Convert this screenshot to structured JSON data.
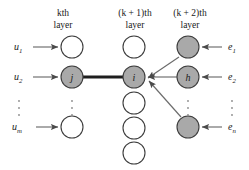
{
  "figure": {
    "kind": "neural-network-layer-diagram",
    "width": 249,
    "height": 170,
    "background": "#ffffff"
  },
  "colors": {
    "shaded_node_fill": "#a9a9a9",
    "white_node_fill": "#ffffff",
    "node_stroke": "#3d3d3d",
    "thin_edge": "#6b6b6b",
    "thick_edge": "#1e1e1e",
    "text": "#1a1a1a",
    "dots": "#8a8a8a"
  },
  "headers": [
    {
      "id": "layer-k",
      "var": "k",
      "prefix": "",
      "suffix": "th",
      "line1": "kth",
      "line2": "layer",
      "x": 63
    },
    {
      "id": "layer-k-plus-1",
      "var": "k",
      "prefix": "(",
      "suffix": " + 1)th",
      "line1": "(k + 1)th",
      "line2": "layer",
      "x": 135
    },
    {
      "id": "layer-k-plus-2",
      "var": "k",
      "prefix": "(",
      "suffix": " + 2)th",
      "line1": "(k + 2)th",
      "line2": "layer",
      "x": 188
    }
  ],
  "inputs": {
    "label_prefix": "u",
    "items": [
      {
        "id": "u1",
        "base": "u",
        "sub": "1",
        "y": 47
      },
      {
        "id": "u2",
        "base": "u",
        "sub": "2",
        "y": 77
      },
      {
        "id": "um",
        "base": "u",
        "sub": "m",
        "y": 127
      }
    ],
    "ellipsis_y": [
      101,
      108,
      115
    ],
    "ellipsis_x": 19
  },
  "outputs": {
    "label_prefix": "e",
    "items": [
      {
        "id": "e1",
        "base": "e",
        "sub": "1",
        "y": 47
      },
      {
        "id": "e2",
        "base": "e",
        "sub": "2",
        "y": 77
      },
      {
        "id": "en",
        "base": "e",
        "sub": "n",
        "y": 127
      }
    ],
    "ellipsis_y": [
      101,
      108,
      115
    ],
    "ellipsis_x": 231
  },
  "layers": [
    {
      "id": "layer-k",
      "name": "kth layer",
      "cx": 72,
      "nodes": [
        {
          "id": "k-node-1",
          "label": "",
          "shaded": false,
          "cy": 47,
          "r": 11
        },
        {
          "id": "k-node-j",
          "label": "j",
          "shaded": true,
          "cy": 77,
          "r": 11
        },
        {
          "id": "k-node-m",
          "label": "",
          "shaded": false,
          "cy": 127,
          "r": 11
        }
      ],
      "ellipsis_y": [
        101,
        108,
        115
      ]
    },
    {
      "id": "layer-k-plus-1",
      "name": "(k + 1)th layer",
      "cx": 134,
      "nodes": [
        {
          "id": "kp1-node-1",
          "label": "",
          "shaded": false,
          "cy": 47,
          "r": 11
        },
        {
          "id": "kp1-node-i",
          "label": "i",
          "shaded": true,
          "cy": 77,
          "r": 11
        },
        {
          "id": "kp1-node-3",
          "label": "",
          "shaded": false,
          "cy": 103,
          "r": 11
        },
        {
          "id": "kp1-node-4",
          "label": "",
          "shaded": false,
          "cy": 128,
          "r": 11
        },
        {
          "id": "kp1-node-5",
          "label": "",
          "shaded": false,
          "cy": 153,
          "r": 11
        }
      ],
      "ellipsis_y": []
    },
    {
      "id": "layer-k-plus-2",
      "name": "(k + 2)th layer",
      "cx": 188,
      "nodes": [
        {
          "id": "kp2-node-1",
          "label": "",
          "shaded": true,
          "cy": 47,
          "r": 11
        },
        {
          "id": "kp2-node-h",
          "label": "h",
          "shaded": true,
          "cy": 77,
          "r": 11
        },
        {
          "id": "kp2-node-n",
          "label": "",
          "shaded": true,
          "cy": 127,
          "r": 11
        }
      ],
      "ellipsis_y": [
        101,
        108,
        115
      ]
    }
  ],
  "edges": {
    "input_arrows": [
      {
        "id": "arrow-u1",
        "from_x": 33,
        "to_x": 59,
        "y": 47
      },
      {
        "id": "arrow-u2",
        "from_x": 33,
        "to_x": 59,
        "y": 77
      },
      {
        "id": "arrow-um",
        "from_x": 36,
        "to_x": 59,
        "y": 127
      }
    ],
    "output_arrows": [
      {
        "id": "arrow-e1",
        "from_x": 222,
        "to_x": 201,
        "y": 47
      },
      {
        "id": "arrow-e2",
        "from_x": 222,
        "to_x": 201,
        "y": 77
      },
      {
        "id": "arrow-en",
        "from_x": 222,
        "to_x": 201,
        "y": 127
      }
    ],
    "highlighted": {
      "id": "edge-j-to-i",
      "from": "k-node-j",
      "to": "kp1-node-i",
      "weight_style": "thick",
      "x1": 83,
      "y1": 77,
      "x2": 123,
      "y2": 77
    },
    "backprop": [
      {
        "id": "edge-kp2-1-to-i",
        "from": "kp2-node-1",
        "to": "kp1-node-i",
        "x1": 179,
        "y1": 56,
        "x2": 146,
        "y2": 79
      },
      {
        "id": "edge-kp2-h-to-i",
        "from": "kp2-node-h",
        "to": "kp1-node-i",
        "x1": 177,
        "y1": 77,
        "x2": 146,
        "y2": 77
      },
      {
        "id": "edge-kp2-n-to-i",
        "from": "kp2-node-n",
        "to": "kp1-node-i",
        "x1": 181,
        "y1": 118,
        "x2": 147,
        "y2": 81
      }
    ]
  }
}
